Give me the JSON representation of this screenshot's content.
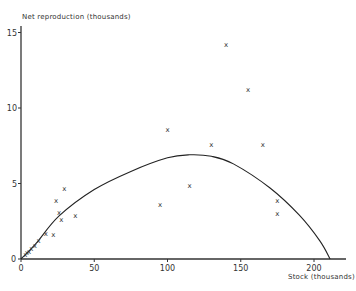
{
  "chart_data": {
    "type": "scatter",
    "title": "",
    "xlabel": "Stock (thousands)",
    "ylabel": "Net reproduction (thousands)",
    "xlim": [
      0,
      220
    ],
    "ylim": [
      0,
      15.5
    ],
    "x_ticks": [
      0,
      50,
      100,
      150,
      200
    ],
    "y_ticks": [
      0,
      5,
      10,
      15
    ],
    "x_tick_labels": [
      "0",
      "50",
      "100",
      "150",
      "200"
    ],
    "y_tick_labels": [
      "0",
      "5",
      "10",
      "15"
    ],
    "grid": false,
    "legend": null,
    "series": [
      {
        "name": "Observed",
        "marker": "x",
        "points": [
          {
            "x": 3,
            "y": 0.3
          },
          {
            "x": 4,
            "y": 0.4
          },
          {
            "x": 5.5,
            "y": 0.5
          },
          {
            "x": 7,
            "y": 0.7
          },
          {
            "x": 9.5,
            "y": 0.9
          },
          {
            "x": 12,
            "y": 1.2
          },
          {
            "x": 17,
            "y": 1.7
          },
          {
            "x": 22,
            "y": 1.6
          },
          {
            "x": 27.5,
            "y": 2.6
          },
          {
            "x": 26,
            "y": 3.1
          },
          {
            "x": 24,
            "y": 3.9
          },
          {
            "x": 29.5,
            "y": 4.7
          },
          {
            "x": 37,
            "y": 2.9
          },
          {
            "x": 95,
            "y": 3.6
          },
          {
            "x": 100,
            "y": 8.6
          },
          {
            "x": 115,
            "y": 4.9
          },
          {
            "x": 130,
            "y": 7.6
          },
          {
            "x": 140,
            "y": 14.2
          },
          {
            "x": 155,
            "y": 11.2
          },
          {
            "x": 165,
            "y": 7.6
          },
          {
            "x": 175,
            "y": 3.9
          },
          {
            "x": 175,
            "y": 3.0
          }
        ]
      },
      {
        "name": "Fitted curve",
        "type": "line",
        "points": [
          {
            "x": 0,
            "y": 0
          },
          {
            "x": 10,
            "y": 1.0
          },
          {
            "x": 26,
            "y": 2.85
          },
          {
            "x": 50,
            "y": 4.6
          },
          {
            "x": 75,
            "y": 5.8
          },
          {
            "x": 100,
            "y": 6.7
          },
          {
            "x": 115,
            "y": 6.9
          },
          {
            "x": 130,
            "y": 6.8
          },
          {
            "x": 145,
            "y": 6.3
          },
          {
            "x": 170,
            "y": 4.7
          },
          {
            "x": 190,
            "y": 2.9
          },
          {
            "x": 204,
            "y": 1.2
          },
          {
            "x": 211,
            "y": 0
          }
        ]
      }
    ]
  },
  "axes": {
    "x_label": "Stock (thousands)",
    "y_label": "Net reproduction (thousands)",
    "x_ticks": [
      "0",
      "50",
      "100",
      "150",
      "200"
    ],
    "y_ticks": [
      "0",
      "5",
      "10",
      "15"
    ]
  }
}
